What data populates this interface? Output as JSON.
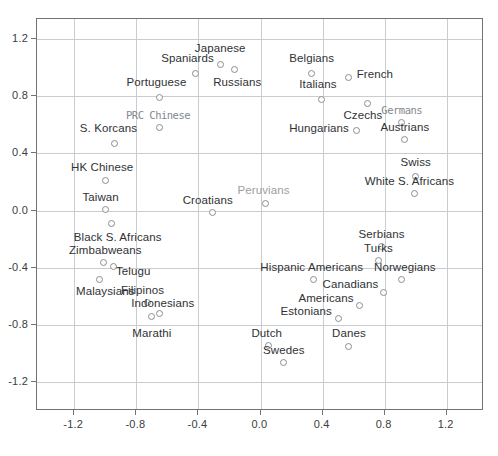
{
  "chart_data": {
    "type": "scatter",
    "title": "",
    "xlabel": "",
    "ylabel": "",
    "xlim": [
      -1.44,
      1.44
    ],
    "ylim": [
      -1.4,
      1.34
    ],
    "grid": true,
    "legend": "none",
    "xticks": [
      "-1.2",
      "-0.8",
      "-0.4",
      "0.0",
      "0.4",
      "0.8",
      "1.2"
    ],
    "xtick_values": [
      -1.2,
      -0.8,
      -0.4,
      0.0,
      0.4,
      0.8,
      1.2
    ],
    "yticks": [
      "1.2",
      "0.8",
      "0.4",
      "0.0",
      "-0.4",
      "-0.8",
      "-1.2"
    ],
    "ytick_values": [
      1.2,
      0.8,
      0.4,
      0.0,
      -0.4,
      -0.8,
      -1.2
    ],
    "marker": "open-circle",
    "marker_color": "#8a8f93",
    "points": [
      {
        "label": "Japanese",
        "x": -0.26,
        "y": 1.02,
        "lx": -0.26,
        "ly": 1.13,
        "anchor": "mid"
      },
      {
        "label": "Spaniards",
        "x": -0.42,
        "y": 0.96,
        "lx": -0.47,
        "ly": 1.06,
        "anchor": "mid"
      },
      {
        "label": "Russians",
        "x": -0.17,
        "y": 0.99,
        "lx": -0.15,
        "ly": 0.89,
        "anchor": "mid"
      },
      {
        "label": "Belgians",
        "x": 0.33,
        "y": 0.96,
        "lx": 0.33,
        "ly": 1.06,
        "anchor": "mid"
      },
      {
        "label": "French",
        "x": 0.57,
        "y": 0.93,
        "lx": 0.62,
        "ly": 0.95,
        "anchor": "start"
      },
      {
        "label": "Italians",
        "x": 0.39,
        "y": 0.78,
        "lx": 0.37,
        "ly": 0.88,
        "anchor": "mid"
      },
      {
        "label": "Portuguese",
        "x": -0.65,
        "y": 0.79,
        "lx": -0.67,
        "ly": 0.89,
        "anchor": "mid"
      },
      {
        "label": "Czechs",
        "x": 0.69,
        "y": 0.75,
        "lx": 0.66,
        "ly": 0.66,
        "anchor": "mid"
      },
      {
        "label": "Germans",
        "x": 0.91,
        "y": 0.62,
        "lx": 0.91,
        "ly": 0.7,
        "anchor": "mid",
        "style": "garbled"
      },
      {
        "label": "PRC Chinese",
        "x": -0.65,
        "y": 0.58,
        "lx": -0.66,
        "ly": 0.66,
        "anchor": "mid",
        "style": "garbled"
      },
      {
        "label": "Hungarians",
        "x": 0.62,
        "y": 0.56,
        "lx": 0.57,
        "ly": 0.57,
        "anchor": "end"
      },
      {
        "label": "Austrians",
        "x": 0.93,
        "y": 0.5,
        "lx": 0.93,
        "ly": 0.58,
        "anchor": "mid"
      },
      {
        "label": "S. Korcans",
        "x": -0.94,
        "y": 0.47,
        "lx": -0.98,
        "ly": 0.57,
        "anchor": "mid"
      },
      {
        "label": "Swiss",
        "x": 1.0,
        "y": 0.24,
        "lx": 1.0,
        "ly": 0.33,
        "anchor": "mid"
      },
      {
        "label": "HK Chinese",
        "x": -1.0,
        "y": 0.21,
        "lx": -1.02,
        "ly": 0.3,
        "anchor": "mid"
      },
      {
        "label": "White S. Africans",
        "x": 0.99,
        "y": 0.12,
        "lx": 0.96,
        "ly": 0.2,
        "anchor": "mid"
      },
      {
        "label": "Peruvians",
        "x": 0.03,
        "y": 0.05,
        "lx": 0.02,
        "ly": 0.14,
        "anchor": "mid",
        "style": "faded"
      },
      {
        "label": "Taiwan",
        "x": -1.0,
        "y": 0.01,
        "lx": -1.03,
        "ly": 0.09,
        "anchor": "mid"
      },
      {
        "label": "Croatians",
        "x": -0.31,
        "y": -0.01,
        "lx": -0.34,
        "ly": 0.07,
        "anchor": "mid"
      },
      {
        "label": "Black S. Africans",
        "x": -0.96,
        "y": -0.09,
        "lx": -0.92,
        "ly": -0.19,
        "anchor": "mid"
      },
      {
        "label": "Serbians",
        "x": 0.78,
        "y": -0.25,
        "lx": 0.78,
        "ly": -0.17,
        "anchor": "mid"
      },
      {
        "label": "Zimbabweans",
        "x": -1.01,
        "y": -0.36,
        "lx": -1.0,
        "ly": -0.28,
        "anchor": "mid"
      },
      {
        "label": "Turks",
        "x": 0.76,
        "y": -0.35,
        "lx": 0.76,
        "ly": -0.27,
        "anchor": "mid"
      },
      {
        "label": "Telugu",
        "x": -0.95,
        "y": -0.39,
        "lx": -0.82,
        "ly": -0.43,
        "anchor": "mid"
      },
      {
        "label": "Malaysians",
        "x": -1.04,
        "y": -0.48,
        "lx": -1.0,
        "ly": -0.57,
        "anchor": "mid"
      },
      {
        "label": "Hispanic Americans",
        "x": 0.34,
        "y": -0.48,
        "lx": 0.33,
        "ly": -0.4,
        "anchor": "mid"
      },
      {
        "label": "Norwegians",
        "x": 0.91,
        "y": -0.48,
        "lx": 0.93,
        "ly": -0.4,
        "anchor": "mid"
      },
      {
        "label": "Canadians",
        "x": 0.79,
        "y": -0.57,
        "lx": 0.76,
        "ly": -0.52,
        "anchor": "end"
      },
      {
        "label": "Filipinos",
        "x": -0.73,
        "y": -0.64,
        "lx": -0.76,
        "ly": -0.56,
        "anchor": "mid"
      },
      {
        "label": "Americans",
        "x": 0.64,
        "y": -0.66,
        "lx": 0.6,
        "ly": -0.62,
        "anchor": "end"
      },
      {
        "label": "Estonians",
        "x": 0.5,
        "y": -0.75,
        "lx": 0.46,
        "ly": -0.71,
        "anchor": "end"
      },
      {
        "label": "Indonesians",
        "x": -0.65,
        "y": -0.72,
        "lx": -0.63,
        "ly": -0.65,
        "anchor": "mid"
      },
      {
        "label": "Marathi",
        "x": -0.7,
        "y": -0.74,
        "lx": -0.7,
        "ly": -0.86,
        "anchor": "mid"
      },
      {
        "label": "Dutch",
        "x": 0.05,
        "y": -0.94,
        "lx": 0.04,
        "ly": -0.86,
        "anchor": "mid"
      },
      {
        "label": "Danes",
        "x": 0.57,
        "y": -0.95,
        "lx": 0.57,
        "ly": -0.86,
        "anchor": "mid"
      },
      {
        "label": "Swedes",
        "x": 0.15,
        "y": -1.06,
        "lx": 0.15,
        "ly": -0.98,
        "anchor": "mid"
      }
    ]
  }
}
